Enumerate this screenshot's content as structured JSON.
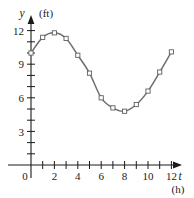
{
  "chart_data": {
    "type": "line",
    "title": "",
    "subtitle": "",
    "xlabel": "t",
    "xunit": "(h)",
    "ylabel": "y",
    "yunit": "(ft)",
    "x": [
      0,
      1,
      2,
      3,
      4,
      5,
      6,
      7,
      8,
      9,
      10,
      11,
      12
    ],
    "values": [
      10.0,
      11.4,
      11.8,
      11.3,
      9.8,
      8.2,
      6.0,
      5.1,
      4.8,
      5.4,
      6.6,
      8.3,
      10.1
    ],
    "series": [
      {
        "name": "water depth",
        "values": [
          10.0,
          11.4,
          11.8,
          11.3,
          9.8,
          8.2,
          6.0,
          5.1,
          4.8,
          5.4,
          6.6,
          8.3,
          10.1
        ]
      }
    ],
    "xlim": [
      0,
      12
    ],
    "ylim": [
      0,
      12.6
    ],
    "xticks": [
      0,
      1,
      2,
      3,
      4,
      5,
      6,
      7,
      8,
      9,
      10,
      11,
      12
    ],
    "xtick_labels": [
      "0",
      "",
      "2",
      "",
      "4",
      "",
      "6",
      "",
      "8",
      "",
      "10",
      "",
      "12"
    ],
    "yticks": [
      0,
      1,
      2,
      3,
      4,
      5,
      6,
      7,
      8,
      9,
      10,
      11,
      12
    ],
    "ytick_labels": [
      "0",
      "",
      "",
      "3",
      "",
      "",
      "6",
      "",
      "",
      "9",
      "",
      "",
      "12"
    ],
    "grid": false,
    "legend": "none",
    "marker": "open-square",
    "line_color": "#6f6f6f",
    "axis_color": "#1a1a1a",
    "marker_fill": "#ffffff",
    "background": "#ffffff"
  },
  "axes": {
    "y_axis_name": "y",
    "y_axis_unit": "(ft)",
    "x_axis_name": "t",
    "x_axis_unit": "(h)",
    "origin_label": "0"
  },
  "y_tick_labels": [
    {
      "value": 12,
      "label": "12"
    },
    {
      "value": 9,
      "label": "9"
    },
    {
      "value": 6,
      "label": "6"
    },
    {
      "value": 3,
      "label": "3"
    }
  ],
  "x_tick_labels": [
    {
      "value": 2,
      "label": "2"
    },
    {
      "value": 4,
      "label": "4"
    },
    {
      "value": 6,
      "label": "6"
    },
    {
      "value": 8,
      "label": "8"
    },
    {
      "value": 10,
      "label": "10"
    },
    {
      "value": 12,
      "label": "12"
    }
  ]
}
